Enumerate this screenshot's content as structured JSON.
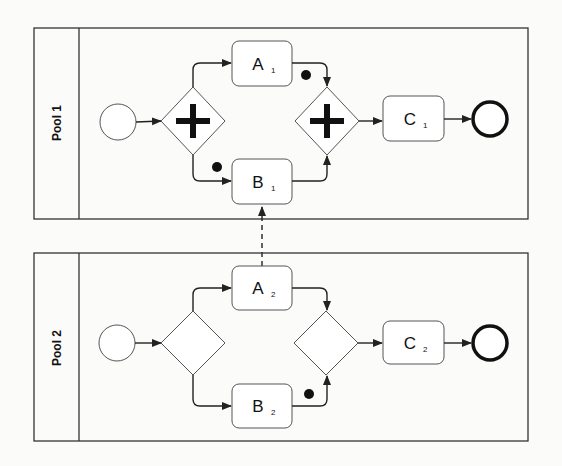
{
  "diagram": {
    "type": "BPMN collaboration",
    "colors": {
      "stroke": "#333333",
      "background": "#fbfbfa",
      "token": "#111111"
    },
    "pools": [
      {
        "label": "Pool 1",
        "start_event": "start-event",
        "split_gateway": "parallel",
        "tasks": [
          {
            "label": "A",
            "sub": "1"
          },
          {
            "label": "B",
            "sub": "1"
          },
          {
            "label": "C",
            "sub": "1"
          }
        ],
        "join_gateway": "parallel",
        "end_event": "end-event",
        "tokens": [
          "on flow split→B1",
          "on flow A1→join"
        ]
      },
      {
        "label": "Pool 2",
        "start_event": "start-event",
        "split_gateway": "exclusive",
        "tasks": [
          {
            "label": "A",
            "sub": "2"
          },
          {
            "label": "B",
            "sub": "2"
          },
          {
            "label": "C",
            "sub": "2"
          }
        ],
        "join_gateway": "exclusive",
        "end_event": "end-event",
        "tokens": [
          "on flow B2→join"
        ]
      }
    ],
    "message_flow": {
      "from": "A2",
      "to": "B1",
      "style": "dashed"
    }
  }
}
